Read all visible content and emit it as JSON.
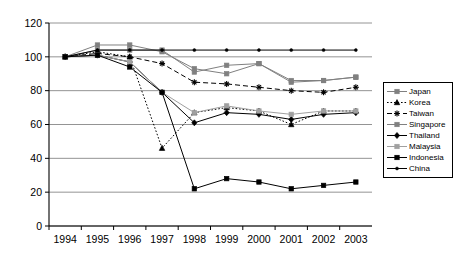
{
  "chart_data": {
    "type": "line",
    "title": "",
    "subtitle": "",
    "xlabel": "",
    "ylabel": "",
    "x": [
      1994,
      1995,
      1996,
      1997,
      1998,
      1999,
      2000,
      2001,
      2002,
      2003
    ],
    "xtick_labels": [
      "1994",
      "1995",
      "1996",
      "1997",
      "1998",
      "1999",
      "2000",
      "2001",
      "2002",
      "2003"
    ],
    "ylim": [
      0,
      120
    ],
    "ytick_labels": [
      "0",
      "20",
      "40",
      "60",
      "80",
      "100",
      "120"
    ],
    "ytick_values": [
      0,
      20,
      40,
      60,
      80,
      100,
      120
    ],
    "grid": true,
    "legend_position": "right",
    "series": [
      {
        "name": "Japan",
        "values": [
          100,
          104,
          104,
          104,
          91,
          95,
          96,
          86,
          86,
          88
        ],
        "color": "#808080",
        "line_style": "solid",
        "marker": "square"
      },
      {
        "name": "Korea",
        "values": [
          100,
          103,
          100,
          46,
          67,
          70,
          68,
          60,
          68,
          68
        ],
        "color": "#000000",
        "line_style": "dotted",
        "marker": "triangle"
      },
      {
        "name": "Taiwan",
        "values": [
          100,
          102,
          100,
          96,
          85,
          84,
          82,
          80,
          79,
          82
        ],
        "color": "#000000",
        "line_style": "dashed",
        "marker": "star"
      },
      {
        "name": "Singapore",
        "values": [
          100,
          107,
          107,
          103,
          93,
          90,
          96,
          85,
          86,
          88
        ],
        "color": "#808080",
        "line_style": "solid",
        "marker": "square"
      },
      {
        "name": "Thailand",
        "values": [
          100,
          101,
          97,
          79,
          61,
          67,
          66,
          63,
          66,
          67
        ],
        "color": "#000000",
        "line_style": "solid",
        "marker": "diamond"
      },
      {
        "name": "Malaysia",
        "values": [
          100,
          101,
          97,
          79,
          67,
          71,
          68,
          66,
          68,
          68
        ],
        "color": "#a0a0a0",
        "line_style": "solid",
        "marker": "square"
      },
      {
        "name": "Indonesia",
        "values": [
          100,
          101,
          94,
          79,
          22,
          28,
          26,
          22,
          24,
          26
        ],
        "color": "#000000",
        "line_style": "solid",
        "marker": "square"
      },
      {
        "name": "China",
        "values": [
          100,
          104,
          104,
          104,
          104,
          104,
          104,
          104,
          104,
          104
        ],
        "color": "#000000",
        "line_style": "solid",
        "marker": "dot"
      }
    ]
  }
}
